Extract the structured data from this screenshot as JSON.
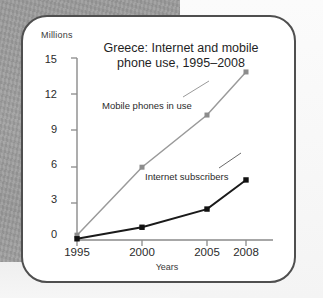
{
  "chart_data": {
    "type": "line",
    "title": "Greece: Internet and mobile phone use, 1995–2008",
    "title_line1": "Greece: Internet and mobile",
    "title_line2": "phone use, 1995–2008",
    "xlabel": "Years",
    "ylabel": "Millions",
    "x": [
      1995,
      2000,
      2005,
      2008
    ],
    "xticklabels": [
      "1995",
      "2000",
      "2005",
      "2008"
    ],
    "xlim": [
      1995,
      2008
    ],
    "ylim": [
      0,
      15
    ],
    "yticks": [
      0,
      3,
      6,
      9,
      12,
      15
    ],
    "yticklabels": [
      "0",
      "3",
      "6",
      "9",
      "12",
      "15"
    ],
    "grid": false,
    "legend": "inline-annotations",
    "series": [
      {
        "name": "Mobile phones in use",
        "values": [
          0.4,
          6.0,
          10.3,
          13.85
        ],
        "color": "#9a9a9a",
        "marker": "square",
        "marker_color": "#8c8c8c"
      },
      {
        "name": "Internet subscribers",
        "values": [
          0.1,
          1.05,
          2.55,
          4.95
        ],
        "color": "#1a1a1a",
        "marker": "square",
        "marker_color": "#111111"
      }
    ],
    "annotations": [
      {
        "text": "Mobile phones in use",
        "series": "Mobile phones in use"
      },
      {
        "text": "Internet subscribers",
        "series": "Internet subscribers"
      }
    ]
  },
  "colors": {
    "card_background": "#ffffff",
    "card_border": "#4f4f4f",
    "page_background_left": "#9d9d9d",
    "page_background_right": "#f8f8f8",
    "axis": "#8a8a8a",
    "mobile_series": "#9a9a9a",
    "internet_series": "#1a1a1a",
    "text": "#2b2b2b"
  }
}
